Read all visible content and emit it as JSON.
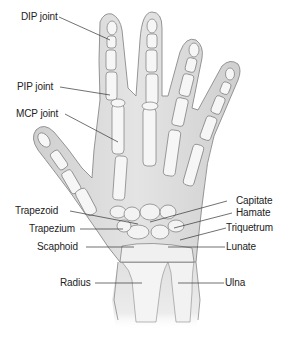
{
  "figure": {
    "colors": {
      "background": "#ffffff",
      "skin_fill": "#d9d9d9",
      "skin_outline": "#8a8a8a",
      "bone_fill": "#f6f6f6",
      "bone_outline": "#7a7a7a",
      "leader_line": "#333333",
      "label_text": "#222222"
    }
  },
  "labels": {
    "left": [
      {
        "id": "dip",
        "text": "DIP joint"
      },
      {
        "id": "pip",
        "text": "PIP joint"
      },
      {
        "id": "mcp",
        "text": "MCP joint"
      },
      {
        "id": "trapezoid",
        "text": "Trapezoid"
      },
      {
        "id": "trapezium",
        "text": "Trapezium"
      },
      {
        "id": "scaphoid",
        "text": "Scaphoid"
      },
      {
        "id": "radius",
        "text": "Radius"
      }
    ],
    "right": [
      {
        "id": "capitate",
        "text": "Capitate"
      },
      {
        "id": "hamate",
        "text": "Hamate"
      },
      {
        "id": "triquetrum",
        "text": "Triquetrum"
      },
      {
        "id": "lunate",
        "text": "Lunate"
      },
      {
        "id": "ulna",
        "text": "Ulna"
      }
    ]
  }
}
